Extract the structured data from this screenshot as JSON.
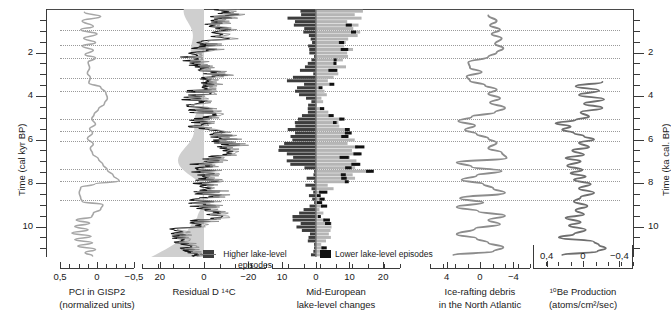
{
  "figure": {
    "type": "multi-panel-correlation-plot",
    "domain": "paleoclimate",
    "guide_lines_kyr": [
      0.95,
      1.65,
      2.25,
      3.15,
      3.75,
      5.05,
      5.6,
      6.05,
      7.35,
      7.9,
      8.8
    ]
  },
  "y_axis_left": {
    "title": "Time (cal kyr BP)",
    "ticks": [
      "2",
      "4",
      "6",
      "8",
      "10"
    ],
    "tick_values": [
      2,
      4,
      6,
      8,
      10
    ],
    "range": [
      0,
      11.4
    ],
    "minor_step": 0.5
  },
  "y_axis_right": {
    "title": "Time (ka cal. BP)",
    "ticks": [
      "2",
      "4",
      "6",
      "8",
      "10"
    ],
    "tick_values": [
      2,
      4,
      6,
      8,
      10
    ],
    "range": [
      0,
      11.4
    ],
    "minor_step": 0.5
  },
  "panels": [
    {
      "id": "pci-gisp2",
      "title_line1": "PCI in GISP2",
      "title_line2": "(normalized units)",
      "x_ticks": [
        "0,5",
        "0",
        "−0,5"
      ],
      "x_tick_values": [
        0.5,
        0,
        -0.5
      ],
      "x_reversed": true,
      "series_type": "line",
      "series_color": "#a6a6a6",
      "line_width": 1.6
    },
    {
      "id": "residual-d14c",
      "title_line1": "Residual D ¹⁴C",
      "title_line2": "",
      "x_ticks": [
        "20",
        "0",
        "−20"
      ],
      "x_tick_values": [
        20,
        0,
        -20
      ],
      "x_reversed": true,
      "series_type": "filled-wiggle",
      "series_color": "#111111",
      "fill_color": "#c9c9c9"
    },
    {
      "id": "mid-european-lake-level",
      "title_line1": "Mid-European",
      "title_line2": "lake-level changes",
      "x_ticks": [
        "10",
        "0",
        "10",
        "20"
      ],
      "x_tick_values": [
        -10,
        0,
        10,
        20
      ],
      "x_reversed": false,
      "series_type": "diverging-bars",
      "higher_color": "#3d3d3d",
      "lower_color": "#b5b5b5",
      "accent_color": "#111111"
    },
    {
      "id": "ice-rafting-debris",
      "title_line1": "Ice-rafting debris",
      "title_line2": "in the North Atlantic",
      "x_ticks": [
        "4",
        "0",
        "−4"
      ],
      "x_tick_values": [
        4,
        0,
        -4
      ],
      "x_reversed": true,
      "series_type": "line",
      "series_color": "#8c8c8c",
      "line_width": 1.9
    },
    {
      "id": "be10-production",
      "title_line1": "¹⁰Be Production",
      "title_line2": "(atoms/cm²/sec)",
      "x_ticks": [
        "0,4",
        "0",
        "−0,4"
      ],
      "x_tick_values": [
        0.4,
        0,
        -0.4
      ],
      "x_reversed": true,
      "series_type": "line",
      "series_color": "#6f6f6f",
      "line_width": 1.9,
      "labels_on_top": true,
      "data_start_kyr": 3.3
    }
  ],
  "annotations": {
    "higher": {
      "line1": "Higher lake-level",
      "line2": "episodes",
      "swatch_color": "#3d3d3d"
    },
    "lower": {
      "line1": "Lower lake-level episodes",
      "swatch_color": "#111111"
    }
  },
  "chart_data": {
    "type": "line",
    "title": "",
    "ylabel": "Time (cal kyr BP)",
    "ylim": [
      0,
      11.4
    ],
    "panels": [
      {
        "name": "PCI in GISP2",
        "xlabel": "PCI in GISP2 (normalized units)",
        "xlim": [
          0.5,
          -0.5
        ],
        "points": [
          [
            0.17,
            0.15
          ],
          [
            -0.05,
            0.35
          ],
          [
            0.2,
            0.55
          ],
          [
            0.05,
            0.8
          ],
          [
            0.22,
            0.95
          ],
          [
            0.0,
            1.15
          ],
          [
            0.18,
            1.35
          ],
          [
            0.02,
            1.55
          ],
          [
            0.2,
            1.7
          ],
          [
            0.05,
            1.9
          ],
          [
            0.16,
            2.1
          ],
          [
            0.02,
            2.25
          ],
          [
            0.12,
            2.45
          ],
          [
            0.1,
            2.7
          ],
          [
            0.13,
            2.95
          ],
          [
            0.09,
            3.15
          ],
          [
            0.11,
            3.4
          ],
          [
            -0.05,
            3.6
          ],
          [
            -0.12,
            3.85
          ],
          [
            -0.14,
            4.1
          ],
          [
            -0.1,
            4.35
          ],
          [
            -0.02,
            4.6
          ],
          [
            0.04,
            4.85
          ],
          [
            0.07,
            5.05
          ],
          [
            0.02,
            5.3
          ],
          [
            0.1,
            5.5
          ],
          [
            0.06,
            5.7
          ],
          [
            0.13,
            5.95
          ],
          [
            0.05,
            6.2
          ],
          [
            0.09,
            6.4
          ],
          [
            0.06,
            6.65
          ],
          [
            -0.02,
            6.9
          ],
          [
            -0.08,
            7.15
          ],
          [
            -0.14,
            7.4
          ],
          [
            -0.22,
            7.65
          ],
          [
            -0.3,
            7.9
          ],
          [
            0.03,
            8.05
          ],
          [
            0.22,
            8.2
          ],
          [
            0.24,
            8.45
          ],
          [
            0.22,
            8.7
          ],
          [
            0.2,
            8.85
          ],
          [
            -0.08,
            9.0
          ],
          [
            -0.05,
            9.2
          ],
          [
            0.05,
            9.4
          ],
          [
            0.07,
            9.55
          ],
          [
            0.28,
            9.7
          ],
          [
            0.1,
            9.85
          ],
          [
            0.3,
            10.0
          ],
          [
            0.12,
            10.15
          ],
          [
            0.34,
            10.3
          ],
          [
            0.08,
            10.45
          ],
          [
            0.3,
            10.6
          ],
          [
            0.06,
            10.75
          ],
          [
            0.26,
            10.9
          ],
          [
            0.02,
            11.05
          ],
          [
            0.16,
            11.2
          ],
          [
            0.06,
            11.35
          ]
        ]
      },
      {
        "name": "Residual D 14C",
        "xlabel": "Residual D 14C",
        "xlim": [
          25,
          -25
        ],
        "note": "dense high-frequency wiggle with grey shading right of zero"
      },
      {
        "name": "Mid-European lake-level changes",
        "xlabel": "Mid-European lake-level changes",
        "xlim": [
          -13,
          25
        ],
        "note": "back-to-back horizontal histogram; grey = lower lake-level episodes to the right, dark = higher lake-level episodes to the left"
      },
      {
        "name": "Ice-rafting debris in the North Atlantic",
        "xlabel": "Ice-rafting debris in the North Atlantic",
        "xlim": [
          6,
          -6
        ],
        "points": [
          [
            -1.0,
            0.3
          ],
          [
            -2.0,
            0.55
          ],
          [
            -1.2,
            0.75
          ],
          [
            -2.4,
            0.95
          ],
          [
            -1.4,
            1.15
          ],
          [
            -2.6,
            1.35
          ],
          [
            -1.8,
            1.6
          ],
          [
            -2.8,
            1.8
          ],
          [
            -2.0,
            2.0
          ],
          [
            -1.0,
            2.2
          ],
          [
            1.4,
            2.45
          ],
          [
            1.2,
            2.7
          ],
          [
            -0.2,
            2.9
          ],
          [
            1.6,
            3.1
          ],
          [
            1.2,
            3.3
          ],
          [
            -0.6,
            3.5
          ],
          [
            -2.0,
            3.7
          ],
          [
            -1.0,
            3.9
          ],
          [
            -2.4,
            4.1
          ],
          [
            -1.2,
            4.3
          ],
          [
            -3.0,
            4.55
          ],
          [
            -1.8,
            4.75
          ],
          [
            1.0,
            4.95
          ],
          [
            2.6,
            5.15
          ],
          [
            0.6,
            5.35
          ],
          [
            1.8,
            5.55
          ],
          [
            0.4,
            5.75
          ],
          [
            -1.0,
            5.95
          ],
          [
            -2.0,
            6.15
          ],
          [
            -1.0,
            6.4
          ],
          [
            -2.6,
            6.6
          ],
          [
            -3.2,
            6.85
          ],
          [
            2.8,
            7.05
          ],
          [
            1.0,
            7.25
          ],
          [
            -2.6,
            7.45
          ],
          [
            0.4,
            7.65
          ],
          [
            2.2,
            7.85
          ],
          [
            -0.4,
            8.05
          ],
          [
            -1.6,
            8.25
          ],
          [
            -3.0,
            8.45
          ],
          [
            2.4,
            8.7
          ],
          [
            -0.4,
            8.9
          ],
          [
            2.8,
            9.1
          ],
          [
            0.2,
            9.3
          ],
          [
            -3.0,
            9.5
          ],
          [
            -1.0,
            9.7
          ],
          [
            -2.4,
            9.9
          ],
          [
            0.6,
            10.1
          ],
          [
            2.8,
            10.35
          ],
          [
            0.4,
            10.55
          ],
          [
            -1.0,
            10.75
          ],
          [
            -2.8,
            10.95
          ],
          [
            -1.6,
            11.15
          ],
          [
            3.2,
            11.3
          ]
        ]
      },
      {
        "name": "10Be Production",
        "xlabel": "10Be Production (atoms/cm2/sec)",
        "xlim": [
          0.55,
          -0.55
        ],
        "points": [
          [
            -0.22,
            3.35
          ],
          [
            0.1,
            3.55
          ],
          [
            -0.18,
            3.75
          ],
          [
            0.06,
            3.95
          ],
          [
            -0.24,
            4.15
          ],
          [
            0.0,
            4.35
          ],
          [
            -0.22,
            4.55
          ],
          [
            0.04,
            4.75
          ],
          [
            -0.06,
            4.95
          ],
          [
            0.1,
            5.1
          ],
          [
            0.34,
            5.25
          ],
          [
            0.16,
            5.4
          ],
          [
            0.26,
            5.55
          ],
          [
            0.12,
            5.7
          ],
          [
            0.0,
            5.85
          ],
          [
            -0.12,
            6.0
          ],
          [
            0.06,
            6.15
          ],
          [
            -0.06,
            6.35
          ],
          [
            0.14,
            6.5
          ],
          [
            0.0,
            6.7
          ],
          [
            0.22,
            6.85
          ],
          [
            0.04,
            7.0
          ],
          [
            0.2,
            7.2
          ],
          [
            0.02,
            7.4
          ],
          [
            0.16,
            7.55
          ],
          [
            -0.02,
            7.7
          ],
          [
            0.12,
            7.85
          ],
          [
            -0.08,
            8.05
          ],
          [
            0.06,
            8.25
          ],
          [
            -0.12,
            8.45
          ],
          [
            0.04,
            8.65
          ],
          [
            0.12,
            8.85
          ],
          [
            -0.04,
            9.05
          ],
          [
            0.1,
            9.25
          ],
          [
            0.0,
            9.45
          ],
          [
            0.22,
            9.6
          ],
          [
            0.04,
            9.8
          ],
          [
            0.18,
            9.95
          ],
          [
            -0.02,
            10.15
          ],
          [
            0.12,
            10.35
          ],
          [
            0.3,
            10.5
          ],
          [
            -0.12,
            10.7
          ],
          [
            -0.18,
            10.85
          ],
          [
            -0.26,
            11.0
          ],
          [
            -0.16,
            11.15
          ],
          [
            0.26,
            11.3
          ]
        ]
      }
    ]
  }
}
